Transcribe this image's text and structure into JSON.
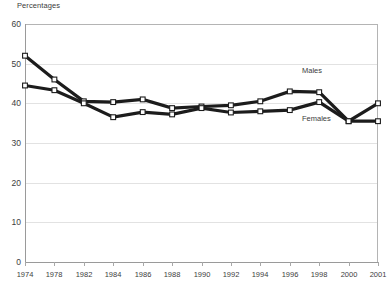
{
  "chart_data": {
    "type": "line",
    "title": "Percentages",
    "xlabel": "",
    "ylabel": "",
    "ylim": [
      0,
      60
    ],
    "ytick_step": 10,
    "yticks": [
      0,
      10,
      20,
      30,
      40,
      50,
      60
    ],
    "grid": true,
    "grid_axis": "y",
    "legend_position": "inline-annotations",
    "categories": [
      "1974",
      "1978",
      "1982",
      "1984",
      "1986",
      "1988",
      "1990",
      "1992",
      "1994",
      "1996",
      "1998",
      "2000",
      "2001"
    ],
    "series": [
      {
        "name": "Males",
        "color": "#1c1c1c",
        "marker": "square-open",
        "values": [
          52.0,
          46.0,
          40.5,
          40.3,
          41.0,
          38.8,
          39.2,
          39.5,
          40.5,
          43.0,
          42.8,
          35.5,
          40.0
        ]
      },
      {
        "name": "Females",
        "color": "#1c1c1c",
        "marker": "square-open",
        "values": [
          44.5,
          43.3,
          40.0,
          36.5,
          37.8,
          37.2,
          38.8,
          37.7,
          38.0,
          38.3,
          40.3,
          35.5,
          35.5
        ]
      }
    ],
    "annotations": [
      {
        "text": "Males",
        "series": "Males"
      },
      {
        "text": "Females",
        "series": "Females"
      }
    ]
  },
  "axes": {
    "y_labels": [
      "60",
      "50",
      "40",
      "30",
      "20",
      "10",
      "0"
    ],
    "x_labels": [
      "1974",
      "1978",
      "1982",
      "1984",
      "1986",
      "1988",
      "1990",
      "1992",
      "1994",
      "1996",
      "1998",
      "2000",
      "2001"
    ]
  },
  "labels": {
    "title": "Percentages",
    "males": "Males",
    "females": "Females"
  }
}
